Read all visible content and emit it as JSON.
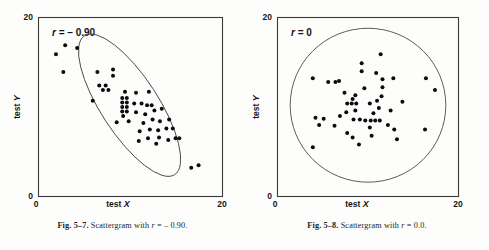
{
  "figures": [
    {
      "id": "fig-5-7",
      "caption_bold": "Fig. 5–7.",
      "caption_rest_a": " Scattergram with ",
      "caption_italic": "r",
      "caption_rest_b": " = – 0.90.",
      "caption_full": "Fig. 5–7. Scattergram with r = – 0.90.",
      "r_label_italic": "r",
      "r_label_value": " = – 0.90",
      "r_value": -0.9,
      "xlabel_static": "test ",
      "xlabel_italic": "X",
      "ylabel_static": "test ",
      "ylabel_italic": "Y",
      "x_ticks": [
        "0",
        "20"
      ],
      "y_ticks": [
        "0",
        "20"
      ],
      "envelope": "ellipse",
      "chart_data": {
        "type": "scatter",
        "title": "Fig. 5–7. Scattergram with r = – 0.90.",
        "annotation": "r = – 0.90",
        "xlabel": "test X",
        "ylabel": "test Y",
        "xlim": [
          0,
          20
        ],
        "ylim": [
          0,
          20
        ],
        "x_ticks": [
          0,
          20
        ],
        "y_ticks": [
          0,
          20
        ],
        "grid": false,
        "legend": null,
        "correlation": -0.9,
        "envelope": {
          "shape": "ellipse",
          "center": [
            9.9,
            10.2
          ],
          "semi_major": 9.0,
          "semi_minor": 3.2,
          "rotation_deg": -57
        },
        "points": [
          [
            2.9,
            16.9
          ],
          [
            4.2,
            16.6
          ],
          [
            1.9,
            15.9
          ],
          [
            2.7,
            13.9
          ],
          [
            6.4,
            13.9
          ],
          [
            8.1,
            14.2
          ],
          [
            8.1,
            13.5
          ],
          [
            6.6,
            12.4
          ],
          [
            7.3,
            12.4
          ],
          [
            7.0,
            11.9
          ],
          [
            7.6,
            11.9
          ],
          [
            5.9,
            10.7
          ],
          [
            9.4,
            11.7
          ],
          [
            10.6,
            11.6
          ],
          [
            12.0,
            11.7
          ],
          [
            9.1,
            11.0
          ],
          [
            9.6,
            11.0
          ],
          [
            9.1,
            10.5
          ],
          [
            9.6,
            10.5
          ],
          [
            9.1,
            10.0
          ],
          [
            9.6,
            10.0
          ],
          [
            9.1,
            9.5
          ],
          [
            9.6,
            9.5
          ],
          [
            9.2,
            9.0
          ],
          [
            10.4,
            10.4
          ],
          [
            11.2,
            10.4
          ],
          [
            11.8,
            10.2
          ],
          [
            12.3,
            10.2
          ],
          [
            10.6,
            9.4
          ],
          [
            11.6,
            9.2
          ],
          [
            12.6,
            9.6
          ],
          [
            13.4,
            9.8
          ],
          [
            8.5,
            8.3
          ],
          [
            9.8,
            8.4
          ],
          [
            11.4,
            8.2
          ],
          [
            12.4,
            8.6
          ],
          [
            13.2,
            8.4
          ],
          [
            14.2,
            8.6
          ],
          [
            11.0,
            7.3
          ],
          [
            12.1,
            7.5
          ],
          [
            13.0,
            7.4
          ],
          [
            13.9,
            7.6
          ],
          [
            14.6,
            7.6
          ],
          [
            11.9,
            6.5
          ],
          [
            13.1,
            6.6
          ],
          [
            14.1,
            6.3
          ],
          [
            14.9,
            6.5
          ],
          [
            15.3,
            6.5
          ],
          [
            10.9,
            6.2
          ],
          [
            12.8,
            5.9
          ],
          [
            16.6,
            3.2
          ],
          [
            17.4,
            3.5
          ]
        ]
      }
    },
    {
      "id": "fig-5-8",
      "caption_bold": "Fig. 5–8.",
      "caption_rest_a": " Scattergram with ",
      "caption_italic": "r",
      "caption_rest_b": " = 0.0.",
      "caption_full": "Fig. 5–8. Scattergram with r = 0.0.",
      "r_label_italic": "r",
      "r_label_value": " = 0",
      "r_value": 0,
      "xlabel_static": "test ",
      "xlabel_italic": "X",
      "ylabel_static": "test ",
      "ylabel_italic": "Y",
      "x_ticks": [
        "0",
        "20"
      ],
      "y_ticks": [
        "0",
        "20"
      ],
      "envelope": "circle",
      "chart_data": {
        "type": "scatter",
        "title": "Fig. 5–8. Scattergram with r = 0.0.",
        "annotation": "r = 0",
        "xlabel": "test X",
        "ylabel": "test Y",
        "xlim": [
          0,
          20
        ],
        "ylim": [
          0,
          20
        ],
        "x_ticks": [
          0,
          20
        ],
        "y_ticks": [
          0,
          20
        ],
        "grid": false,
        "legend": null,
        "correlation": 0.0,
        "envelope": {
          "shape": "circle",
          "center": [
            10.0,
            10.2
          ],
          "radius": 8.6
        },
        "points": [
          [
            11.4,
            15.9
          ],
          [
            9.3,
            14.9
          ],
          [
            9.3,
            14.0
          ],
          [
            10.9,
            13.8
          ],
          [
            3.9,
            13.2
          ],
          [
            5.6,
            12.8
          ],
          [
            6.4,
            12.8
          ],
          [
            6.8,
            12.9
          ],
          [
            11.6,
            13.1
          ],
          [
            12.8,
            13.2
          ],
          [
            16.4,
            13.2
          ],
          [
            11.6,
            12.2
          ],
          [
            17.4,
            11.9
          ],
          [
            7.4,
            11.6
          ],
          [
            8.6,
            11.3
          ],
          [
            8.3,
            10.9
          ],
          [
            11.5,
            11.2
          ],
          [
            7.7,
            10.4
          ],
          [
            8.2,
            10.4
          ],
          [
            8.7,
            10.4
          ],
          [
            10.2,
            10.4
          ],
          [
            11.0,
            10.7
          ],
          [
            13.8,
            10.6
          ],
          [
            7.6,
            9.4
          ],
          [
            8.6,
            9.6
          ],
          [
            10.6,
            9.3
          ],
          [
            11.2,
            9.9
          ],
          [
            4.2,
            8.8
          ],
          [
            5.1,
            8.7
          ],
          [
            8.4,
            8.6
          ],
          [
            9.1,
            8.6
          ],
          [
            9.7,
            8.5
          ],
          [
            10.3,
            8.5
          ],
          [
            10.8,
            8.5
          ],
          [
            11.3,
            8.5
          ],
          [
            4.6,
            8.0
          ],
          [
            6.3,
            7.9
          ],
          [
            12.2,
            8.0
          ],
          [
            10.2,
            7.7
          ],
          [
            12.9,
            7.5
          ],
          [
            16.3,
            7.5
          ],
          [
            7.7,
            7.1
          ],
          [
            8.3,
            6.6
          ],
          [
            10.4,
            6.8
          ],
          [
            13.2,
            6.4
          ],
          [
            9.0,
            5.8
          ],
          [
            3.9,
            5.5
          ],
          [
            6.9,
            9.0
          ],
          [
            12.5,
            9.6
          ],
          [
            9.6,
            12.1
          ]
        ]
      }
    }
  ]
}
